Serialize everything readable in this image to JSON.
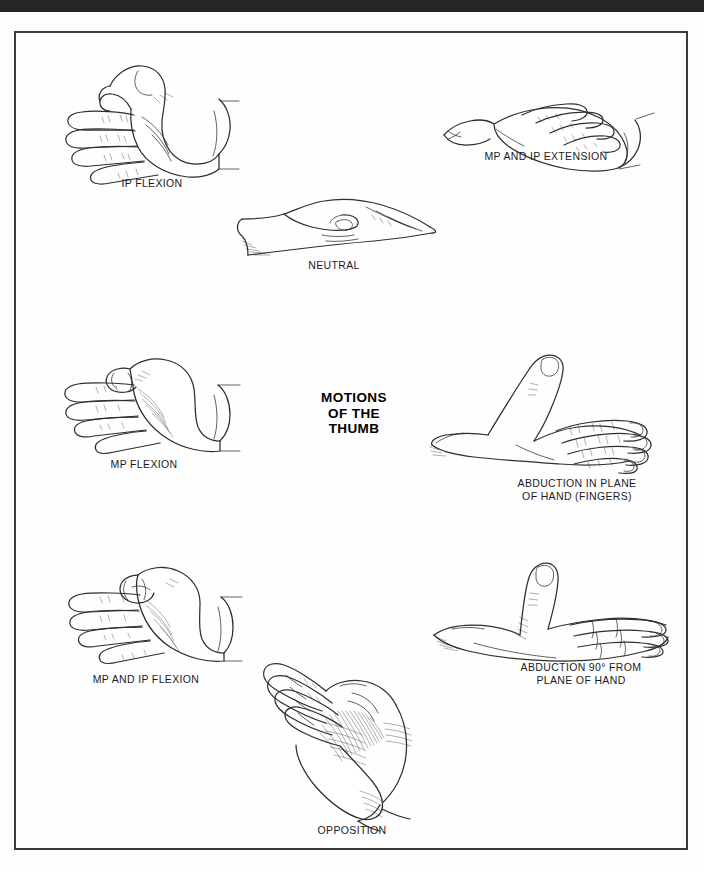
{
  "page": {
    "title": "MOTIONS OF THE THUMB",
    "background_color": "#fdfdfd",
    "top_bar_color": "#262626",
    "border_color": "#3a3a3a",
    "line_color": "#2e2e2e"
  },
  "title_block": {
    "line1": "MOTIONS",
    "line2": "OF THE",
    "line3": "THUMB"
  },
  "figures": [
    {
      "id": "ip-flexion",
      "caption": "IP FLEXION",
      "position": "top-left",
      "description": "Hand in profile, palm facing viewer, thumb interphalangeal joint flexed"
    },
    {
      "id": "mp-and-ip-extension",
      "caption": "MP AND IP EXTENSION",
      "position": "top-right",
      "description": "Hand in profile with thumb fully extended at MP and IP joints"
    },
    {
      "id": "neutral",
      "caption": "NEUTRAL",
      "position": "top-center",
      "description": "Hand resting flat, thumb alongside index finger in neutral position"
    },
    {
      "id": "mp-flexion",
      "caption": "MP FLEXION",
      "position": "middle-left",
      "description": "Hand in profile with thumb metacarpophalangeal joint flexed across palm"
    },
    {
      "id": "abduction-in-plane-of-hand",
      "caption": "ABDUCTION IN PLANE\nOF HAND (FINGERS)",
      "position": "middle-right",
      "description": "Hand viewed from dorsum with thumb abducted within the plane of the hand"
    },
    {
      "id": "mp-and-ip-flexion",
      "caption": "MP AND IP FLEXION",
      "position": "bottom-left",
      "description": "Hand in profile with thumb flexed at both MP and IP joints into the palm"
    },
    {
      "id": "abduction-90-from-plane-of-hand",
      "caption": "ABDUCTION 90° FROM\nPLANE OF HAND",
      "position": "bottom-right",
      "description": "Hand flat with thumb abducted ninety degrees perpendicular to the palm"
    },
    {
      "id": "opposition",
      "caption": "OPPOSITION",
      "position": "bottom-center",
      "description": "Thumb pad opposed to the fingertips, shaded thenar eminence"
    }
  ]
}
